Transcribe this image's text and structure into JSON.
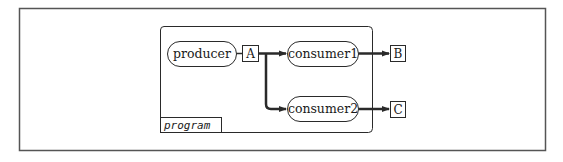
{
  "diagram": {
    "colors": {
      "stroke": "#2a2a2a",
      "frame": "#555555",
      "background": "#ffffff"
    },
    "container": {
      "label": "program"
    },
    "processes": [
      {
        "id": "producer",
        "label": "producer"
      },
      {
        "id": "consumer1",
        "label": "consumer1"
      },
      {
        "id": "consumer2",
        "label": "consumer2"
      }
    ],
    "channels": [
      {
        "id": "A",
        "label": "A"
      },
      {
        "id": "B",
        "label": "B"
      },
      {
        "id": "C",
        "label": "C"
      }
    ],
    "edges": [
      {
        "from": "producer",
        "to": "A"
      },
      {
        "from": "A",
        "to": "consumer1"
      },
      {
        "from": "A",
        "to": "consumer2"
      },
      {
        "from": "consumer1",
        "to": "B"
      },
      {
        "from": "consumer2",
        "to": "C"
      }
    ]
  }
}
